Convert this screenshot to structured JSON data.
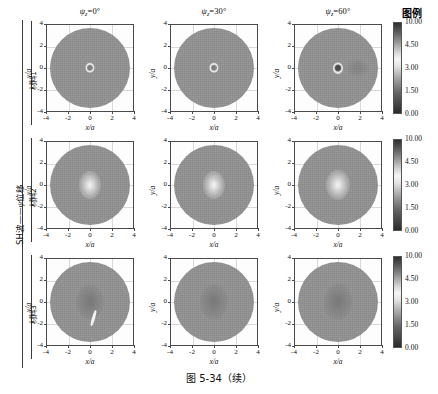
{
  "figure": {
    "caption": "图 5-34（续）",
    "legend_title": "图例",
    "group_label_main": "SH波——ψ位移",
    "row_labels": [
      "材料1",
      "材料2",
      "材料3"
    ],
    "column_headers": [
      {
        "symbol": "ψ",
        "sub": "z",
        "eq": "=",
        "value": "0",
        "deg": "°"
      },
      {
        "symbol": "ψ",
        "sub": "z",
        "eq": "=",
        "value": "30",
        "deg": "°"
      },
      {
        "symbol": "ψ",
        "sub": "z",
        "eq": "=",
        "value": "60",
        "deg": "°"
      }
    ]
  },
  "axes": {
    "xlabel": "x/a",
    "ylabel": "y/a",
    "xticks": [
      "-4",
      "-2",
      "0",
      "2",
      "4"
    ],
    "yticks": [
      "4",
      "2",
      "0",
      "-2",
      "-4"
    ],
    "xlim": [
      -4,
      4
    ],
    "ylim": [
      -4,
      4
    ]
  },
  "colorbar": {
    "ticks": [
      "10.00",
      "4.50",
      "3.00",
      "1.50",
      "0.00"
    ],
    "vmin": 0.0,
    "vmax": 10.0,
    "colormap": "grayscale"
  },
  "chart_data": {
    "type": "heatmap",
    "title": "图 5-34（续）",
    "subtitle": "SH波——ψ位移",
    "xlabel": "x/a",
    "ylabel": "y/a",
    "xlim": [
      -4,
      4
    ],
    "ylim": [
      -4,
      4
    ],
    "grid": true,
    "legend_position": "right",
    "colorbar_ticks": [
      10.0,
      4.5,
      3.0,
      1.5,
      0.0
    ],
    "colorbar_range": [
      0.0,
      10.0
    ],
    "rows": [
      "材料1",
      "材料2",
      "材料3"
    ],
    "columns": [
      "ψz=0°",
      "ψz=30°",
      "ψz=60°"
    ],
    "panels": [
      {
        "row": "材料1",
        "column": "ψz=0°",
        "background_level": 3.0,
        "features": [
          {
            "kind": "ring",
            "center": [
              0,
              0
            ],
            "radius": 0.45,
            "level": 8.5
          },
          {
            "kind": "core",
            "center": [
              0,
              0
            ],
            "radius": 0.22,
            "level": 3.6
          }
        ]
      },
      {
        "row": "材料1",
        "column": "ψz=30°",
        "background_level": 3.0,
        "features": [
          {
            "kind": "ring",
            "center": [
              0,
              0
            ],
            "radius": 0.45,
            "level": 8.5
          },
          {
            "kind": "core",
            "center": [
              0,
              0
            ],
            "radius": 0.22,
            "level": 3.4
          }
        ]
      },
      {
        "row": "材料1",
        "column": "ψz=60°",
        "background_level": 3.0,
        "features": [
          {
            "kind": "ring",
            "center": [
              0,
              0
            ],
            "radius": 0.5,
            "level": 8.8
          },
          {
            "kind": "core",
            "center": [
              0,
              0
            ],
            "radius": 0.3,
            "level": 1.2
          },
          {
            "kind": "lobe",
            "center": [
              2.0,
              0.0
            ],
            "radius": 0.6,
            "level": 2.2
          }
        ]
      },
      {
        "row": "材料2",
        "column": "ψz=0°",
        "background_level": 3.0,
        "features": [
          {
            "kind": "blob",
            "center": [
              0,
              0
            ],
            "radius": 0.55,
            "level": 6.8
          }
        ]
      },
      {
        "row": "材料2",
        "column": "ψz=30°",
        "background_level": 3.0,
        "features": [
          {
            "kind": "blob",
            "center": [
              0,
              0
            ],
            "radius": 0.55,
            "level": 6.5
          }
        ]
      },
      {
        "row": "材料2",
        "column": "ψz=60°",
        "background_level": 3.0,
        "features": [
          {
            "kind": "blob",
            "center": [
              0,
              0
            ],
            "radius": 0.6,
            "level": 6.9
          }
        ]
      },
      {
        "row": "材料3",
        "column": "ψz=0°",
        "background_level": 3.0,
        "features": [
          {
            "kind": "blob",
            "center": [
              0,
              0
            ],
            "radius": 0.7,
            "level": 2.0
          },
          {
            "kind": "streak",
            "center": [
              0.3,
              -1.6
            ],
            "level": 9.5
          }
        ]
      },
      {
        "row": "材料3",
        "column": "ψz=30°",
        "background_level": 3.0,
        "features": [
          {
            "kind": "blob",
            "center": [
              0,
              0
            ],
            "radius": 0.7,
            "level": 2.1
          }
        ]
      },
      {
        "row": "材料3",
        "column": "ψz=60°",
        "background_level": 3.0,
        "features": [
          {
            "kind": "blob",
            "center": [
              0,
              0
            ],
            "radius": 0.72,
            "level": 2.0
          }
        ]
      }
    ]
  }
}
